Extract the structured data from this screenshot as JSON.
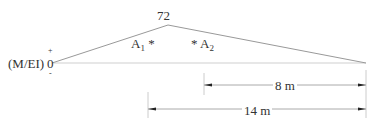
{
  "diagram": {
    "type": "moment-area diagram (M/EI)",
    "axis_label": "(M/EI)",
    "origin_label": "0",
    "plus_sign": "+",
    "minus_sign": "-",
    "peak_value": "72",
    "areas": [
      {
        "name": "A",
        "subscript": "1",
        "centroid_marker": "*"
      },
      {
        "name": "A",
        "subscript": "2",
        "centroid_marker": "*"
      }
    ],
    "dimensions": [
      {
        "label": "8 m"
      },
      {
        "label": "14 m"
      }
    ],
    "colors": {
      "line": "#999999",
      "text": "#333333",
      "arrow": "#222222"
    }
  }
}
